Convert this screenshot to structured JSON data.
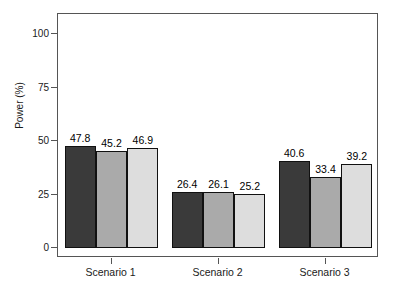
{
  "chart_data": {
    "type": "bar",
    "title": "",
    "subtitle": "",
    "xlabel": "",
    "ylabel": "Power (%)",
    "categories": [
      "Scenario 1",
      "Scenario 2",
      "Scenario 3"
    ],
    "series": [
      {
        "name": "Method 1",
        "color": "#3a3a3a",
        "values": [
          47.8,
          26.4,
          40.6
        ]
      },
      {
        "name": "Method 2",
        "color": "#aaaaaa",
        "values": [
          45.2,
          26.1,
          33.4
        ]
      },
      {
        "name": "Method 3",
        "color": "#dddddd",
        "values": [
          46.9,
          25.2,
          39.2
        ]
      }
    ],
    "ylim": [
      0,
      110
    ],
    "yticks": [
      0,
      25,
      50,
      75,
      100
    ],
    "ytick_labels": [
      "0",
      "25",
      "50",
      "75",
      "100"
    ],
    "grid": false,
    "legend": "none",
    "data_labels": [
      [
        "47.8",
        "45.2",
        "46.9"
      ],
      [
        "26.4",
        "26.1",
        "25.2"
      ],
      [
        "40.6",
        "33.4",
        "39.2"
      ]
    ],
    "frame_color": "#555555",
    "bar_border_color": "#111111",
    "background": "#ffffff"
  }
}
